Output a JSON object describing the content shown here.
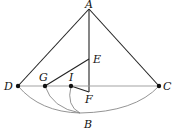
{
  "diagram": {
    "points": {
      "A": {
        "x": 89,
        "y": 9,
        "label": "A",
        "lx": 85,
        "ly": 8
      },
      "B": {
        "x": 80,
        "y": 113,
        "label": "B",
        "lx": 84,
        "ly": 128
      },
      "C": {
        "x": 159,
        "y": 86,
        "label": "C",
        "lx": 163,
        "ly": 90
      },
      "D": {
        "x": 18,
        "y": 86,
        "label": "D",
        "lx": 4,
        "ly": 90
      },
      "E": {
        "x": 89,
        "y": 59,
        "label": "E",
        "lx": 93,
        "ly": 63
      },
      "F": {
        "x": 89,
        "y": 92,
        "label": "F",
        "lx": 85,
        "ly": 103
      },
      "G": {
        "x": 45,
        "y": 86,
        "label": "G",
        "lx": 39,
        "ly": 81
      },
      "I": {
        "x": 71,
        "y": 86,
        "label": "I",
        "lx": 69,
        "ly": 81
      }
    },
    "segments": [
      [
        "A",
        "D"
      ],
      [
        "A",
        "C"
      ],
      [
        "A",
        "F"
      ],
      [
        "D",
        "C"
      ],
      [
        "G",
        "E"
      ],
      [
        "I",
        "F"
      ]
    ],
    "arcs": [
      "D-B",
      "B-C",
      "G-B",
      "I-B"
    ],
    "dots": [
      "D",
      "G",
      "I",
      "C"
    ]
  }
}
